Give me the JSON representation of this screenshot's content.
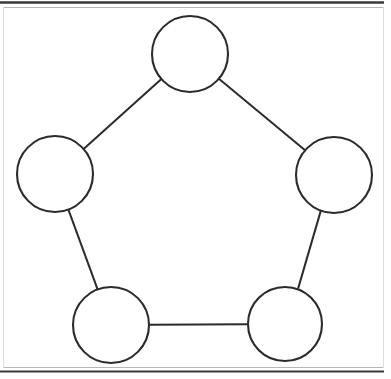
{
  "canvas": {
    "width": 391,
    "height": 379,
    "background_color": "#ffffff",
    "title": "Pentagon node-link diagram"
  },
  "frame": {
    "rule_color": "#3a3a3c",
    "faint_rule_color": "#b6b6ba",
    "top_rule_y": 2.5,
    "bottom_rule_y": 371.5,
    "top_rule_width": 2.4,
    "bottom_rule_width": 2.2,
    "inner_top_y": 7.5,
    "inner_bottom_y": 367.5,
    "inner_left_x": 3.5,
    "inner_right_x": 383.5,
    "rule_x_start": 0,
    "rule_x_end": 384
  },
  "diagram": {
    "type": "node-link-graph",
    "shape": "pentagon-cycle",
    "node_count": 5,
    "edge_count": 5,
    "stroke_color": "#2b2b2d",
    "node_fill": "#ffffff",
    "node_stroke_width": 2.1,
    "edge_stroke_width": 2.0,
    "nodes": [
      {
        "id": "top",
        "name": "node-top",
        "label": "",
        "cx": 190,
        "cy": 54,
        "r": 38
      },
      {
        "id": "left",
        "name": "node-left",
        "label": "",
        "cx": 55,
        "cy": 174,
        "r": 38
      },
      {
        "id": "right",
        "name": "node-right",
        "label": "",
        "cx": 334,
        "cy": 175,
        "r": 38
      },
      {
        "id": "bottom-left",
        "name": "node-bottom-left",
        "label": "",
        "cx": 111,
        "cy": 325,
        "r": 38
      },
      {
        "id": "bottom-right",
        "name": "node-bottom-right",
        "label": "",
        "cx": 285,
        "cy": 324,
        "r": 37
      }
    ],
    "edges": [
      {
        "id": "edge-top-left",
        "from": "top",
        "to": "left",
        "x1": 161.4,
        "y1": 79.1,
        "x2": 83.6,
        "y2": 148.9
      },
      {
        "id": "edge-top-right",
        "from": "top",
        "to": "right",
        "x1": 218.9,
        "y1": 78.8,
        "x2": 305.1,
        "y2": 150.2
      },
      {
        "id": "edge-left-bottomleft",
        "from": "left",
        "to": "bottom-left",
        "x1": 68.4,
        "y1": 209.7,
        "x2": 97.6,
        "y2": 289.3
      },
      {
        "id": "edge-right-bottomright",
        "from": "right",
        "to": "bottom-right",
        "x1": 320.9,
        "y1": 210.4,
        "x2": 298.1,
        "y2": 288.6
      },
      {
        "id": "edge-bottomleft-bottomright",
        "from": "bottom-left",
        "to": "bottom-right",
        "x1": 149.0,
        "y1": 324.8,
        "x2": 248.0,
        "y2": 324.2
      }
    ]
  }
}
